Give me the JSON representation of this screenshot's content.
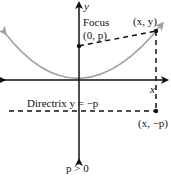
{
  "diagram": {
    "axis_y_label": "y",
    "axis_x_label": "x",
    "focus_label_line1": "Focus",
    "focus_label_line2": "(0, p)",
    "point_label": "(x, y)",
    "directrix_label": "Directrix y = −p",
    "directrix_point_label": "(x, −p)",
    "condition_label": "p > 0",
    "colors": {
      "axes": "#111111",
      "parabola": "#a0a0a0",
      "dashed": "#111111",
      "points": "#111111"
    }
  }
}
